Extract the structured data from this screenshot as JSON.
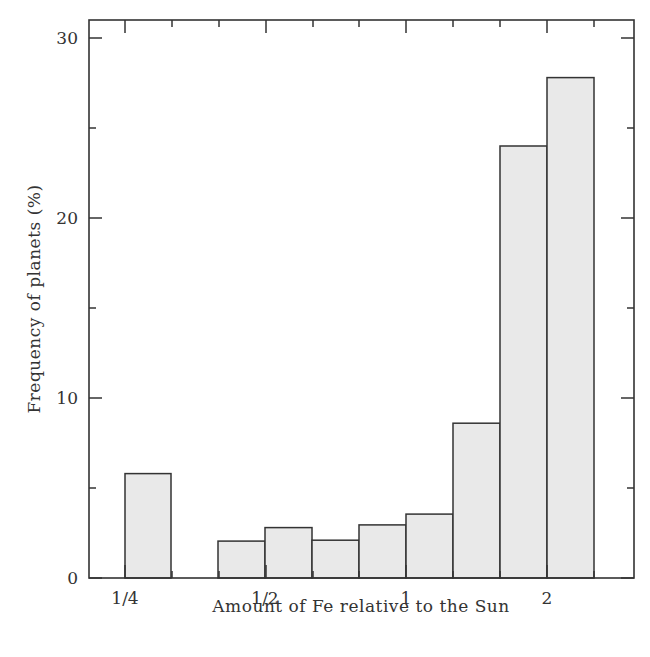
{
  "chart_data": {
    "type": "bar",
    "subtype": "histogram",
    "title": "",
    "xlabel": "Amount of Fe relative to the Sun",
    "ylabel": "Frequency of planets (%)",
    "x_scale": "log2",
    "x_tick_labels": [
      "1/4",
      "1/2",
      "1",
      "2"
    ],
    "y_tick_labels": [
      "0",
      "10",
      "20",
      "30"
    ],
    "ylim": [
      0,
      31
    ],
    "grid": false,
    "legend": null,
    "bins": [
      {
        "x_start_px": 125,
        "x_end_px": 171,
        "value": 5.8
      },
      {
        "x_start_px": 218,
        "x_end_px": 265,
        "value": 2.05
      },
      {
        "x_start_px": 265,
        "x_end_px": 312,
        "value": 2.8
      },
      {
        "x_start_px": 312,
        "x_end_px": 359,
        "value": 2.1
      },
      {
        "x_start_px": 359,
        "x_end_px": 406,
        "value": 2.95
      },
      {
        "x_start_px": 406,
        "x_end_px": 453,
        "value": 3.55
      },
      {
        "x_start_px": 453,
        "x_end_px": 500,
        "value": 8.6
      },
      {
        "x_start_px": 500,
        "x_end_px": 547,
        "value": 24.0
      },
      {
        "x_start_px": 547,
        "x_end_px": 594,
        "value": 27.8
      }
    ],
    "categories": [
      "~0.25-0.31",
      "~0.40-0.50",
      "~0.50-0.63",
      "~0.63-0.79",
      "~0.79-1.0",
      "~1.0-1.26",
      "~1.26-1.58",
      "~1.58-2.0",
      "~2.0-2.5"
    ],
    "values": [
      5.8,
      2.05,
      2.8,
      2.1,
      2.95,
      3.55,
      8.6,
      24.0,
      27.8
    ],
    "colors": {
      "bar_fill": "#e9e9e9",
      "bar_edge": "#333333",
      "axis": "#333333"
    }
  },
  "axes": {
    "x_title": "Amount of Fe relative to the Sun",
    "y_title": "Frequency of planets (%)",
    "x_ticks": [
      {
        "label": "1/4",
        "px": 125
      },
      {
        "label": "1/2",
        "px": 265
      },
      {
        "label": "1",
        "px": 406
      },
      {
        "label": "2",
        "px": 547
      }
    ],
    "y_ticks": [
      {
        "label": "0",
        "value": 0
      },
      {
        "label": "10",
        "value": 10
      },
      {
        "label": "20",
        "value": 20
      },
      {
        "label": "30",
        "value": 30
      }
    ]
  }
}
